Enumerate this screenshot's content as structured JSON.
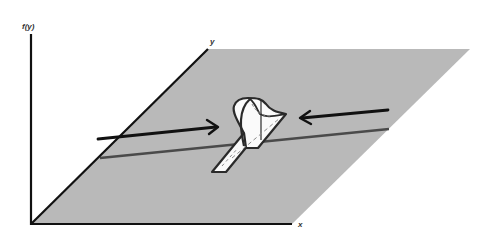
{
  "figure": {
    "colors": {
      "background": "#ffffff",
      "plane": "#b9b9b9",
      "axes": "#111111",
      "line": "#4a4a4a",
      "arrow": "#111111",
      "ridge_fill": "#fafafa",
      "ridge_stroke": "#2a2a2a",
      "dash": "#8a8a8a"
    },
    "axes": {
      "vertical_label": "f(y)",
      "x_label": "x",
      "y_label": "y"
    },
    "arrows": [
      {
        "name": "left-arrow",
        "direction": "right"
      },
      {
        "name": "right-arrow",
        "direction": "left"
      }
    ]
  }
}
